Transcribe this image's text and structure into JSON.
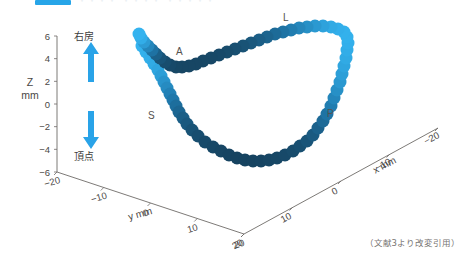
{
  "topbar": {
    "chip_color": "#27a5e8",
    "ghost_text": "・・・・   ・・・・   ・・・・・"
  },
  "annotations": {
    "up_label": "右房",
    "down_label": "頂点",
    "arrow_color": "#29a3e8"
  },
  "point_labels": [
    {
      "id": "A",
      "text": "A",
      "x": 176,
      "y": 46
    },
    {
      "id": "L",
      "text": "L",
      "x": 283,
      "y": 12
    },
    {
      "id": "S",
      "text": "S",
      "x": 148,
      "y": 110
    },
    {
      "id": "P",
      "text": "P",
      "x": 327,
      "y": 108
    }
  ],
  "caption": "（文献3より改変引用）",
  "chart_data": {
    "type": "scatter",
    "title": "",
    "xlabel": "x  mm",
    "ylabel": "y  mm",
    "zlabel": "Z\nmm",
    "axes": {
      "z": {
        "label_line1": "Z",
        "label_line2": "mm",
        "ticks": [
          6,
          4,
          2,
          0,
          -2,
          -4,
          -6
        ],
        "tick_labels": [
          "6",
          "4",
          "2",
          "0",
          "−2",
          "−4",
          "−6"
        ],
        "lim": [
          -6,
          6
        ]
      },
      "y": {
        "label": "y  mm",
        "ticks": [
          -20,
          -10,
          0,
          10,
          20
        ],
        "tick_labels": [
          "−20",
          "−10",
          "0",
          "10",
          "20"
        ],
        "lim": [
          -20,
          20
        ]
      },
      "x": {
        "label": "x  mm",
        "ticks": [
          20,
          10,
          0,
          -10,
          -20
        ],
        "tick_labels": [
          "20",
          "10",
          "0",
          "−10",
          "−20"
        ],
        "lim": [
          -20,
          20
        ]
      }
    },
    "grid": false,
    "legend": "none",
    "colormap": {
      "low": "#153c56",
      "mid": "#1f78ab",
      "high": "#34b3ef"
    },
    "marker": "circle",
    "marker_size_px": 13,
    "series": [
      {
        "name": "loop-trajectory",
        "points_px": [
          [
            142,
            46,
            1.0
          ],
          [
            146,
            52,
            0.98
          ],
          [
            150,
            58,
            0.96
          ],
          [
            154,
            64,
            0.93
          ],
          [
            158,
            70,
            0.88
          ],
          [
            161,
            76,
            0.82
          ],
          [
            164,
            82,
            0.74
          ],
          [
            167,
            88,
            0.66
          ],
          [
            170,
            94,
            0.58
          ],
          [
            173,
            100,
            0.5
          ],
          [
            176,
            106,
            0.42
          ],
          [
            179,
            112,
            0.35
          ],
          [
            183,
            118,
            0.29
          ],
          [
            187,
            124,
            0.24
          ],
          [
            192,
            130,
            0.19
          ],
          [
            198,
            136,
            0.15
          ],
          [
            205,
            142,
            0.12
          ],
          [
            213,
            147,
            0.1
          ],
          [
            221,
            151,
            0.08
          ],
          [
            229,
            155,
            0.07
          ],
          [
            237,
            158,
            0.06
          ],
          [
            245,
            160,
            0.06
          ],
          [
            253,
            161,
            0.06
          ],
          [
            261,
            161,
            0.07
          ],
          [
            269,
            160,
            0.08
          ],
          [
            277,
            158,
            0.09
          ],
          [
            285,
            155,
            0.11
          ],
          [
            293,
            151,
            0.13
          ],
          [
            300,
            146,
            0.16
          ],
          [
            307,
            141,
            0.2
          ],
          [
            313,
            135,
            0.25
          ],
          [
            318,
            128,
            0.31
          ],
          [
            323,
            121,
            0.38
          ],
          [
            327,
            114,
            0.46
          ],
          [
            331,
            106,
            0.54
          ],
          [
            334,
            98,
            0.62
          ],
          [
            337,
            90,
            0.7
          ],
          [
            340,
            82,
            0.77
          ],
          [
            342,
            74,
            0.83
          ],
          [
            344,
            66,
            0.88
          ],
          [
            346,
            58,
            0.92
          ],
          [
            347,
            50,
            0.95
          ],
          [
            348,
            43,
            0.97
          ],
          [
            347,
            37,
            0.98
          ],
          [
            344,
            32,
            0.98
          ],
          [
            338,
            29,
            0.96
          ],
          [
            331,
            27,
            0.92
          ],
          [
            323,
            26,
            0.86
          ],
          [
            315,
            26,
            0.78
          ],
          [
            307,
            27,
            0.7
          ],
          [
            299,
            28,
            0.62
          ],
          [
            291,
            30,
            0.54
          ],
          [
            283,
            32,
            0.46
          ],
          [
            275,
            34,
            0.39
          ],
          [
            267,
            37,
            0.33
          ],
          [
            259,
            40,
            0.28
          ],
          [
            251,
            43,
            0.23
          ],
          [
            243,
            46,
            0.19
          ],
          [
            235,
            49,
            0.16
          ],
          [
            227,
            52,
            0.13
          ],
          [
            219,
            55,
            0.11
          ],
          [
            211,
            58,
            0.1
          ],
          [
            203,
            61,
            0.09
          ],
          [
            196,
            64,
            0.08
          ],
          [
            189,
            66,
            0.08
          ],
          [
            182,
            67,
            0.08
          ],
          [
            176,
            67,
            0.09
          ],
          [
            170,
            65,
            0.11
          ],
          [
            165,
            62,
            0.14
          ],
          [
            160,
            58,
            0.2
          ],
          [
            156,
            54,
            0.3
          ],
          [
            152,
            50,
            0.45
          ],
          [
            148,
            46,
            0.62
          ],
          [
            144,
            42,
            0.8
          ],
          [
            141,
            38,
            0.95
          ],
          [
            139,
            34,
            1.0
          ]
        ]
      }
    ]
  }
}
